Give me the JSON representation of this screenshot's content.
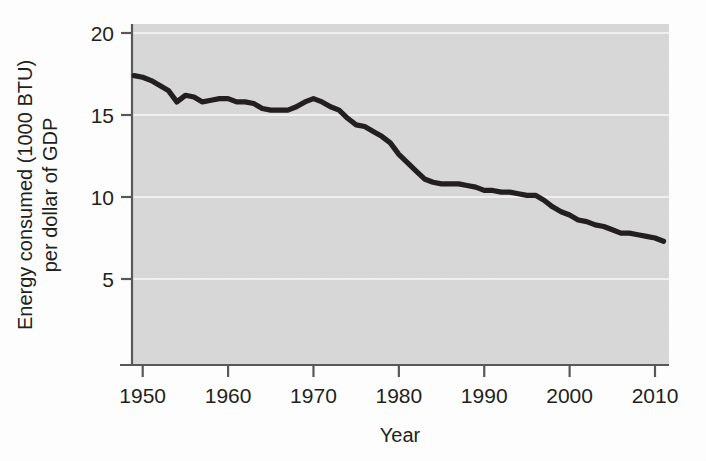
{
  "figure": {
    "background_color": "#ffffff",
    "plot_background_color": "#d9d9d9",
    "line_color": "#231f20",
    "gridline_color": "#f2f2f2",
    "axis_color": "#58595b"
  },
  "axes": {
    "x": {
      "title": "Year",
      "ticks": [
        "1950",
        "1960",
        "1970",
        "1980",
        "1990",
        "2000",
        "2010"
      ],
      "tick_values": [
        1950,
        1960,
        1970,
        1980,
        1990,
        2000,
        2010
      ],
      "range": [
        1947,
        2013
      ]
    },
    "y": {
      "title_line1": "Energy consumed (1000 BTU)",
      "title_line2": "per dollar of GDP",
      "ticks": [
        "5",
        "10",
        "15",
        "20"
      ],
      "tick_values": [
        5,
        10,
        15,
        20
      ],
      "range": [
        0,
        20
      ]
    }
  },
  "chart_data": {
    "type": "line",
    "title": "",
    "subtitle": "",
    "xlabel": "Year",
    "ylabel": "Energy consumed (1000 BTU) per dollar of GDP",
    "xlim": [
      1947,
      2013
    ],
    "ylim": [
      0,
      20
    ],
    "grid": true,
    "legend_position": "none",
    "xticks": [
      1950,
      1960,
      1970,
      1980,
      1990,
      2000,
      2010
    ],
    "yticks": [
      5,
      10,
      15,
      20
    ],
    "series": [
      {
        "name": "Energy intensity",
        "color": "#231f20",
        "x": [
          1949,
          1950,
          1951,
          1952,
          1953,
          1954,
          1955,
          1956,
          1957,
          1958,
          1959,
          1960,
          1961,
          1962,
          1963,
          1964,
          1965,
          1966,
          1967,
          1968,
          1969,
          1970,
          1971,
          1972,
          1973,
          1974,
          1975,
          1976,
          1977,
          1978,
          1979,
          1980,
          1981,
          1982,
          1983,
          1984,
          1985,
          1986,
          1987,
          1988,
          1989,
          1990,
          1991,
          1992,
          1993,
          1994,
          1995,
          1996,
          1997,
          1998,
          1999,
          2000,
          2001,
          2002,
          2003,
          2004,
          2005,
          2006,
          2007,
          2008,
          2009,
          2010,
          2011
        ],
        "values": [
          17.4,
          17.3,
          17.1,
          16.8,
          16.5,
          15.8,
          16.2,
          16.1,
          15.8,
          15.9,
          16.0,
          16.0,
          15.8,
          15.8,
          15.7,
          15.4,
          15.3,
          15.3,
          15.3,
          15.5,
          15.8,
          16.0,
          15.8,
          15.5,
          15.3,
          14.8,
          14.4,
          14.3,
          14.0,
          13.7,
          13.3,
          12.6,
          12.1,
          11.6,
          11.1,
          10.9,
          10.8,
          10.8,
          10.8,
          10.7,
          10.6,
          10.4,
          10.4,
          10.3,
          10.3,
          10.2,
          10.1,
          10.1,
          9.8,
          9.4,
          9.1,
          8.9,
          8.6,
          8.5,
          8.3,
          8.2,
          8.0,
          7.8,
          7.8,
          7.7,
          7.6,
          7.5,
          7.3
        ]
      }
    ]
  }
}
